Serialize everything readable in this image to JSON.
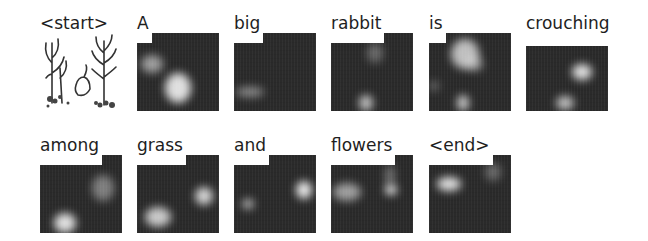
{
  "figure": {
    "caption_words": [
      "<start>",
      "A",
      "big",
      "rabbit",
      "is",
      "crouching",
      "among",
      "grass",
      "and",
      "flowers",
      "<end>"
    ],
    "rows": [
      {
        "panels": [
          {
            "word": "<start>",
            "kind": "input-image"
          },
          {
            "word": "A",
            "kind": "attention-map"
          },
          {
            "word": "big",
            "kind": "attention-map"
          },
          {
            "word": "rabbit",
            "kind": "attention-map"
          },
          {
            "word": "is",
            "kind": "attention-map"
          },
          {
            "word": "crouching",
            "kind": "attention-map"
          }
        ]
      },
      {
        "panels": [
          {
            "word": "among",
            "kind": "attention-map"
          },
          {
            "word": "grass",
            "kind": "attention-map"
          },
          {
            "word": "and",
            "kind": "attention-map"
          },
          {
            "word": "flowers",
            "kind": "attention-map"
          },
          {
            "word": "<end>",
            "kind": "attention-map"
          }
        ]
      }
    ],
    "colors": {
      "background": "#ffffff",
      "map_dark": "#2a2a2a",
      "highlight": "#f2f2f2",
      "text": "#1e1e1e"
    }
  }
}
